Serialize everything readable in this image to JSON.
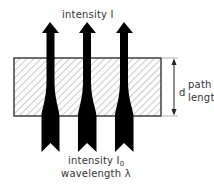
{
  "labels": {
    "output_intensity": "intensity I",
    "input_intensity": "intensity I",
    "input_intensity_subscript": "0",
    "wavelength": "wavelength λ",
    "d_symbol": "d",
    "path": "path",
    "length": "length"
  },
  "sample": {
    "description": "hatched absorbing medium",
    "fill": "#ffffff",
    "hatch_color": "#9a9a9a",
    "border_color": "#222222"
  },
  "beams": {
    "count": 3,
    "color": "#000000",
    "direction": "upward"
  }
}
